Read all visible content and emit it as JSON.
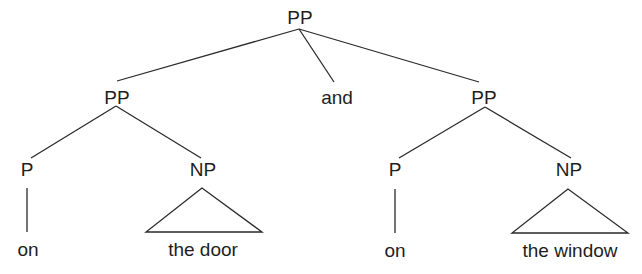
{
  "diagram": {
    "type": "syntax-tree",
    "nodes": {
      "root": {
        "label": "PP"
      },
      "left_pp": {
        "label": "PP"
      },
      "conj": {
        "label": "and"
      },
      "right_pp": {
        "label": "PP"
      },
      "left_p": {
        "label": "P"
      },
      "left_np": {
        "label": "NP"
      },
      "right_p": {
        "label": "P"
      },
      "right_np": {
        "label": "NP"
      },
      "left_p_word": {
        "label": "on"
      },
      "left_np_words": {
        "label": "the door"
      },
      "right_p_word": {
        "label": "on"
      },
      "right_np_words": {
        "label": "the window"
      }
    },
    "edges": [
      [
        "root",
        "left_pp"
      ],
      [
        "root",
        "conj"
      ],
      [
        "root",
        "right_pp"
      ],
      [
        "left_pp",
        "left_p"
      ],
      [
        "left_pp",
        "left_np"
      ],
      [
        "right_pp",
        "right_p"
      ],
      [
        "right_pp",
        "right_np"
      ],
      [
        "left_p",
        "left_p_word"
      ],
      [
        "left_np",
        "left_np_words",
        "triangle"
      ],
      [
        "right_p",
        "right_p_word"
      ],
      [
        "right_np",
        "right_np_words",
        "triangle"
      ]
    ],
    "colors": {
      "line": "#2a2a2a",
      "text": "#1e1e1e",
      "background": "#ffffff"
    }
  }
}
